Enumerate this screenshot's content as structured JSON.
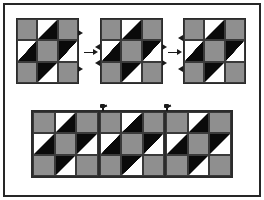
{
  "figure": {
    "background_color": "#ffffff",
    "border_color": "#262626"
  },
  "palette": {
    "gray": "#8f8f8f",
    "black": "#0a0a0a",
    "white": "#ffffff",
    "outline": "#2b2b2b",
    "arrow": "#1a1a1a"
  },
  "block_pattern": {
    "name": "three-by-three-half-square-triangle-block",
    "rows": 3,
    "columns": 3,
    "cells": [
      "gray",
      "hst-wb",
      "gray",
      "hst-wb",
      "gray",
      "hst-bw",
      "gray",
      "hst-bw",
      "gray"
    ]
  },
  "top_row": {
    "label": "individual blocks joined left to right",
    "blocks": [
      {
        "name": "block-1",
        "tabs": [
          "right-top",
          "right-bottom"
        ]
      },
      {
        "name": "block-2",
        "tabs": [
          "left-top",
          "left-bottom",
          "right-top",
          "right-bottom"
        ]
      },
      {
        "name": "block-3",
        "tabs": [
          "left-top",
          "left-bottom"
        ]
      }
    ],
    "arrows": [
      {
        "name": "arrow-1",
        "direction": "right"
      },
      {
        "name": "arrow-2",
        "direction": "right"
      }
    ]
  },
  "bottom_row": {
    "label": "assembled three block strip",
    "block_count": 3,
    "pins": [
      {
        "name": "seam-pin-1"
      },
      {
        "name": "seam-pin-2"
      }
    ]
  }
}
